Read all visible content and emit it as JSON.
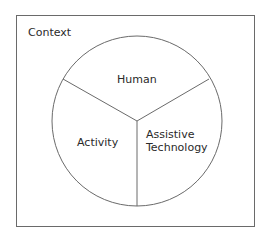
{
  "diagram": {
    "context_label": "Context",
    "segments": [
      {
        "label": "Human"
      },
      {
        "label": "Activity"
      },
      {
        "label": "Assistive Technology",
        "lines": [
          "Assistive",
          "Technology"
        ]
      }
    ],
    "colors": {
      "stroke": "#6a6a6a",
      "text": "#2a2a2a",
      "background": "#ffffff"
    }
  }
}
